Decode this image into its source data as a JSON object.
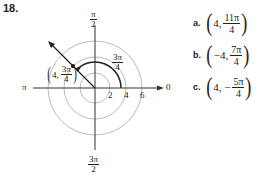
{
  "problem_number": "18.",
  "diagram": {
    "axis_labels": {
      "top": {
        "num": "π",
        "den": "2"
      },
      "bottom": {
        "num": "3π",
        "den": "2"
      },
      "left": "π",
      "right": "0"
    },
    "radius_ticks": [
      "2",
      "4",
      "6"
    ],
    "angle_label": {
      "num": "3π",
      "den": "4"
    },
    "point_label": {
      "r": "4,",
      "num": "3π",
      "den": "4"
    }
  },
  "answers": [
    {
      "letter": "a.",
      "r": "4,",
      "num": "11π",
      "den": "4"
    },
    {
      "letter": "b.",
      "r": "−4,",
      "num": "7π",
      "den": "4"
    },
    {
      "letter": "c.",
      "r": "4, −",
      "num": "5π",
      "den": "4"
    }
  ]
}
